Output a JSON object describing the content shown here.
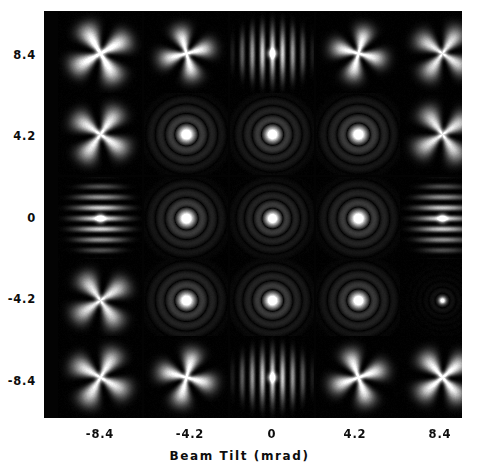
{
  "figure": {
    "background_color": "#ffffff",
    "plot_background_color": "#030303",
    "tick_text_color": "#0d0d0d"
  },
  "axes": {
    "x_title": "Beam Tilt (mrad)",
    "x_ticks": [
      "-8.4",
      "-4.2",
      "0",
      "4.2",
      "8.4"
    ],
    "y_ticks": [
      "8.4",
      "4.2",
      "0",
      "-4.2",
      "-8.4"
    ]
  },
  "chart_data": {
    "type": "heatmap",
    "title": "",
    "subtitle": "",
    "xlabel": "Beam Tilt (mrad)",
    "ylabel": "",
    "xlim": [
      -10.5,
      10.5
    ],
    "ylim": [
      -10.5,
      10.5
    ],
    "grid": false,
    "legend": "none",
    "x": [
      -8.4,
      -4.2,
      0,
      4.2,
      8.4
    ],
    "y": [
      8.4,
      4.2,
      0,
      -4.2,
      -8.4
    ],
    "tiles": [
      {
        "row": 0,
        "col": 0,
        "x": -8.4,
        "y": 8.4,
        "pattern": "four-lobe-star",
        "rotation": 30,
        "spread": 1.25,
        "core": 0.95,
        "brightness": 0.95
      },
      {
        "row": 0,
        "col": 1,
        "x": -4.2,
        "y": 8.4,
        "pattern": "four-lobe-star",
        "rotation": 15,
        "spread": 1.05,
        "core": 1.0,
        "brightness": 0.9
      },
      {
        "row": 0,
        "col": 2,
        "x": 0,
        "y": 8.4,
        "pattern": "vertical-bars",
        "rotation": 0,
        "spread": 1.0,
        "core": 1.0,
        "brightness": 0.95
      },
      {
        "row": 0,
        "col": 3,
        "x": 4.2,
        "y": 8.4,
        "pattern": "four-lobe-star",
        "rotation": -15,
        "spread": 1.05,
        "core": 1.0,
        "brightness": 0.9
      },
      {
        "row": 0,
        "col": 4,
        "x": 8.4,
        "y": 8.4,
        "pattern": "four-lobe-star",
        "rotation": -35,
        "spread": 1.15,
        "core": 0.9,
        "brightness": 0.8
      },
      {
        "row": 1,
        "col": 0,
        "x": -8.4,
        "y": 4.2,
        "pattern": "four-lobe-star",
        "rotation": 55,
        "spread": 1.2,
        "core": 0.9,
        "brightness": 0.85
      },
      {
        "row": 1,
        "col": 1,
        "x": -4.2,
        "y": 4.2,
        "pattern": "rings",
        "rotation": 0,
        "spread": 0.95,
        "core": 1.0,
        "brightness": 1.0
      },
      {
        "row": 1,
        "col": 2,
        "x": 0,
        "y": 4.2,
        "pattern": "rings",
        "rotation": 0,
        "spread": 0.9,
        "core": 1.0,
        "brightness": 1.0
      },
      {
        "row": 1,
        "col": 3,
        "x": 4.2,
        "y": 4.2,
        "pattern": "rings",
        "rotation": 0,
        "spread": 0.95,
        "core": 1.0,
        "brightness": 1.0
      },
      {
        "row": 1,
        "col": 4,
        "x": 8.4,
        "y": 4.2,
        "pattern": "four-lobe-star",
        "rotation": -55,
        "spread": 1.2,
        "core": 0.9,
        "brightness": 0.8
      },
      {
        "row": 2,
        "col": 0,
        "x": -8.4,
        "y": 0,
        "pattern": "horizontal-bars",
        "rotation": 0,
        "spread": 1.0,
        "core": 1.0,
        "brightness": 0.95
      },
      {
        "row": 2,
        "col": 1,
        "x": -4.2,
        "y": 0,
        "pattern": "rings",
        "rotation": 0,
        "spread": 0.95,
        "core": 1.0,
        "brightness": 1.0
      },
      {
        "row": 2,
        "col": 2,
        "x": 0,
        "y": 0,
        "pattern": "rings",
        "rotation": 0,
        "spread": 0.85,
        "core": 1.0,
        "brightness": 1.0
      },
      {
        "row": 2,
        "col": 3,
        "x": 4.2,
        "y": 0,
        "pattern": "rings",
        "rotation": 0,
        "spread": 0.95,
        "core": 1.0,
        "brightness": 1.0
      },
      {
        "row": 2,
        "col": 4,
        "x": 8.4,
        "y": 0,
        "pattern": "horizontal-bars",
        "rotation": 0,
        "spread": 1.0,
        "core": 1.0,
        "brightness": 0.9
      },
      {
        "row": 3,
        "col": 0,
        "x": -8.4,
        "y": -4.2,
        "pattern": "four-lobe-star",
        "rotation": -55,
        "spread": 1.2,
        "core": 0.9,
        "brightness": 0.8
      },
      {
        "row": 3,
        "col": 1,
        "x": -4.2,
        "y": -4.2,
        "pattern": "rings",
        "rotation": 0,
        "spread": 0.95,
        "core": 1.0,
        "brightness": 1.0
      },
      {
        "row": 3,
        "col": 2,
        "x": 0,
        "y": -4.2,
        "pattern": "rings",
        "rotation": 0,
        "spread": 0.9,
        "core": 1.0,
        "brightness": 1.0
      },
      {
        "row": 3,
        "col": 3,
        "x": 4.2,
        "y": -4.2,
        "pattern": "rings",
        "rotation": 0,
        "spread": 0.95,
        "core": 1.0,
        "brightness": 0.95
      },
      {
        "row": 3,
        "col": 4,
        "x": 8.4,
        "y": -4.2,
        "pattern": "compact-dot",
        "rotation": 0,
        "spread": 0.7,
        "core": 1.0,
        "brightness": 0.85
      },
      {
        "row": 4,
        "col": 0,
        "x": -8.4,
        "y": -8.4,
        "pattern": "four-lobe-star",
        "rotation": -30,
        "spread": 1.2,
        "core": 0.9,
        "brightness": 0.85
      },
      {
        "row": 4,
        "col": 1,
        "x": -4.2,
        "y": -8.4,
        "pattern": "four-lobe-star",
        "rotation": -15,
        "spread": 1.1,
        "core": 1.0,
        "brightness": 0.9
      },
      {
        "row": 4,
        "col": 2,
        "x": 0,
        "y": -8.4,
        "pattern": "vertical-bars",
        "rotation": 0,
        "spread": 1.0,
        "core": 1.0,
        "brightness": 0.9
      },
      {
        "row": 4,
        "col": 3,
        "x": 4.2,
        "y": -8.4,
        "pattern": "four-lobe-star",
        "rotation": 20,
        "spread": 1.1,
        "core": 1.0,
        "brightness": 0.9
      },
      {
        "row": 4,
        "col": 4,
        "x": 8.4,
        "y": -8.4,
        "pattern": "four-lobe-star",
        "rotation": 40,
        "spread": 1.15,
        "core": 1.0,
        "brightness": 0.9
      }
    ]
  }
}
